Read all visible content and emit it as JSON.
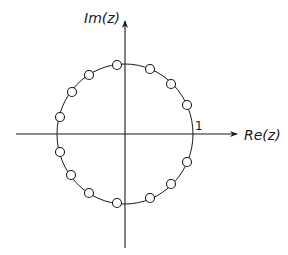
{
  "diagram": {
    "title": "",
    "axes": {
      "x_label": "Re(z)",
      "y_label": "Im(z)",
      "unit_tick_label": "1"
    },
    "colors": {
      "line": "#1a1a1a",
      "background": "#ffffff"
    },
    "geometry": {
      "center": [
        125,
        134
      ],
      "radius_x": 68,
      "radius_y": 70,
      "x_axis": [
        16,
        237
      ],
      "y_axis": [
        21,
        248
      ]
    },
    "unit_circle": {
      "label": "unit circle"
    },
    "zeros": {
      "marker": "o",
      "count": 14,
      "points": [
        [
          187,
          105
        ],
        [
          171,
          84
        ],
        [
          150,
          69
        ],
        [
          117,
          65
        ],
        [
          89,
          75
        ],
        [
          72,
          92
        ],
        [
          60,
          117
        ],
        [
          60,
          152
        ],
        [
          71,
          175
        ],
        [
          89,
          193
        ],
        [
          117,
          203
        ],
        [
          150,
          198
        ],
        [
          171,
          184
        ],
        [
          187,
          162
        ]
      ]
    }
  }
}
